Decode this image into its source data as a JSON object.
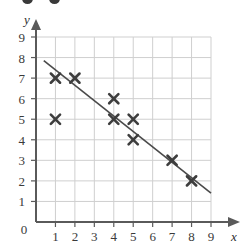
{
  "figure": {
    "name": "scatter-plot-with-line-of-best-fit",
    "background_color": "#ffffff",
    "grid_color": "#cfcfcf",
    "axis_color": "#5a5a5a",
    "marker_color": "#3d3d3d",
    "line_color": "#4a4a4a"
  },
  "chart_data": {
    "type": "scatter",
    "title": "",
    "xlabel": "x",
    "ylabel": "y",
    "xlim": [
      0,
      9
    ],
    "ylim": [
      0,
      9
    ],
    "grid": true,
    "legend": "none",
    "x_ticks": [
      "0",
      "1",
      "2",
      "3",
      "4",
      "5",
      "6",
      "7",
      "8",
      "9"
    ],
    "y_ticks": [
      "0",
      "1",
      "2",
      "3",
      "4",
      "5",
      "6",
      "7",
      "8",
      "9"
    ],
    "x_tick_values": [
      0,
      1,
      2,
      3,
      4,
      5,
      6,
      7,
      8,
      9
    ],
    "y_tick_values": [
      0,
      1,
      2,
      3,
      4,
      5,
      6,
      7,
      8,
      9
    ],
    "origin_label": "0",
    "marker": "x",
    "points": [
      {
        "x": 1,
        "y": 7
      },
      {
        "x": 1,
        "y": 5
      },
      {
        "x": 2,
        "y": 7
      },
      {
        "x": 4,
        "y": 6
      },
      {
        "x": 4,
        "y": 5
      },
      {
        "x": 5,
        "y": 5
      },
      {
        "x": 5,
        "y": 4
      },
      {
        "x": 7,
        "y": 3
      },
      {
        "x": 8,
        "y": 2
      }
    ],
    "series": [
      {
        "name": "data points",
        "x": [
          1,
          1,
          2,
          4,
          4,
          5,
          5,
          7,
          8
        ],
        "values": [
          7,
          5,
          7,
          6,
          5,
          5,
          4,
          3,
          2
        ]
      }
    ],
    "trend_line": {
      "name": "line of best fit",
      "x_start": 0.4,
      "y_start": 7.85,
      "x_end": 9.0,
      "y_end": 1.4,
      "slope": -0.75,
      "intercept": 8.15
    }
  }
}
